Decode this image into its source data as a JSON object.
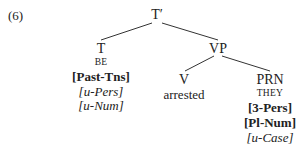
{
  "example_number": "(6)",
  "tree": {
    "root": {
      "label": "T′"
    },
    "t_node": {
      "label": "T",
      "lexical": "BE",
      "features": [
        {
          "text": "[Past-Tns]",
          "style": "bold"
        },
        {
          "text": "[u-Pers]",
          "style": "italic"
        },
        {
          "text": "[u-Num]",
          "style": "italic"
        }
      ]
    },
    "vp_node": {
      "label": "VP"
    },
    "v_node": {
      "label": "V",
      "word": "arrested"
    },
    "prn_node": {
      "label": "PRN",
      "lexical": "THEY",
      "features": [
        {
          "text": "[3-Pers]",
          "style": "bold"
        },
        {
          "text": "[Pl-Num]",
          "style": "bold"
        },
        {
          "text": "[u-Case]",
          "style": "italic"
        }
      ]
    }
  },
  "colors": {
    "text": "#222222",
    "lines": "#333333",
    "background": "#ffffff"
  }
}
